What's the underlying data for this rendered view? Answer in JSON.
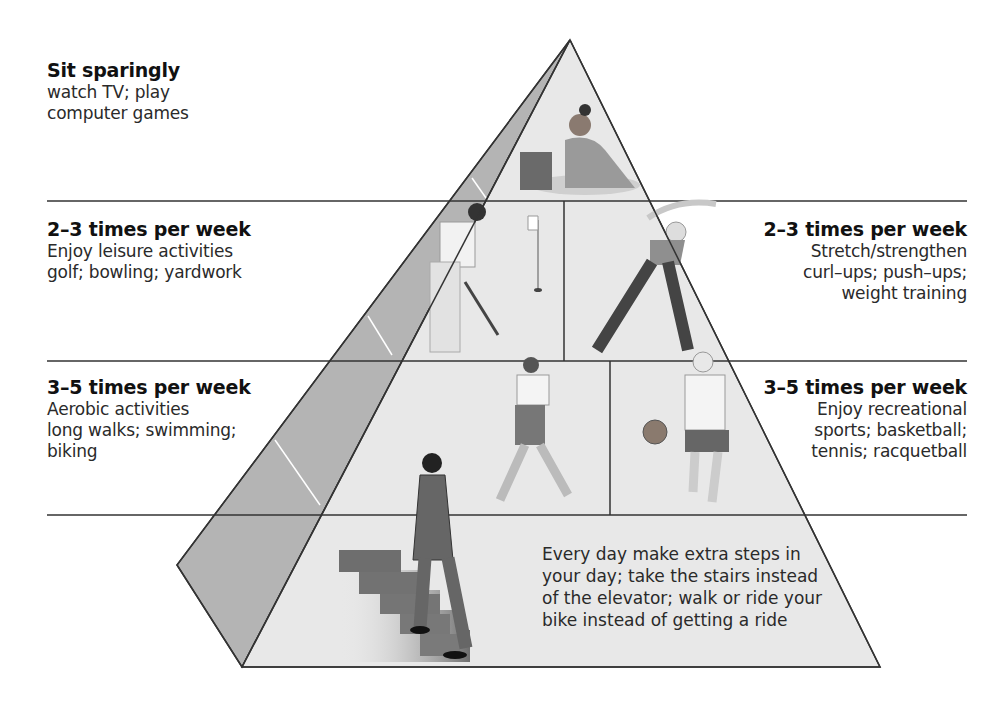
{
  "diagram": {
    "type": "activity-pyramid",
    "tiers": [
      {
        "level": 1,
        "position": "top",
        "frequency": "Sit sparingly",
        "lines": [
          "watch TV; play",
          "computer games"
        ],
        "illustration": "woman-using-laptop"
      },
      {
        "level": 2,
        "position": "left",
        "frequency": "2–3 times per week",
        "lines": [
          "Enjoy leisure activities",
          "golf; bowling; yardwork"
        ],
        "illustration": "man-playing-golf"
      },
      {
        "level": 2,
        "position": "right",
        "frequency": "2–3 times per week",
        "lines": [
          "Stretch/strengthen",
          "curl–ups; push–ups;",
          "weight training"
        ],
        "illustration": "woman-stretching"
      },
      {
        "level": 3,
        "position": "left",
        "frequency": "3–5 times per week",
        "lines": [
          "Aerobic activities",
          "long walks; swimming;",
          "biking"
        ],
        "illustration": "woman-jogging"
      },
      {
        "level": 3,
        "position": "right",
        "frequency": "3–5 times per week",
        "lines": [
          "Enjoy recreational",
          "sports; basketball;",
          "tennis; racquetball"
        ],
        "illustration": "man-dribbling-basketball"
      },
      {
        "level": 4,
        "position": "base",
        "frequency": "Every day",
        "lines": [
          "Every day make extra steps in",
          "your day; take the stairs instead",
          "of the elevator; walk or ride your",
          "bike instead of getting a ride"
        ],
        "illustration": "man-climbing-stairs"
      }
    ],
    "colors": {
      "front_face": "#e6e6e6",
      "side_face": "#b5b5b5",
      "outline": "#333333",
      "text": "#222222"
    }
  }
}
